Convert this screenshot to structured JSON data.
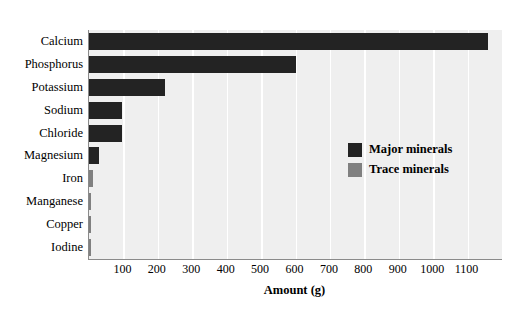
{
  "chart_data": {
    "type": "bar",
    "orientation": "horizontal",
    "title": "",
    "xlabel": "Amount (g)",
    "ylabel": "",
    "xlim": [
      0,
      1200
    ],
    "ylim": null,
    "grid": true,
    "grid_axis": "x",
    "x_ticks": [
      100,
      200,
      300,
      400,
      500,
      600,
      700,
      800,
      900,
      1000,
      1100
    ],
    "x_tick_labels": [
      "100",
      "200",
      "300",
      "400",
      "500",
      "600",
      "700",
      "800",
      "900",
      "1000",
      "1100"
    ],
    "categories": [
      "Calcium",
      "Phosphorus",
      "Potassium",
      "Sodium",
      "Chloride",
      "Magnesium",
      "Iron",
      "Manganese",
      "Copper",
      "Iodine"
    ],
    "values": [
      1160,
      600,
      220,
      95,
      95,
      30,
      12,
      4,
      2,
      1
    ],
    "bar_groups": [
      "major",
      "major",
      "major",
      "major",
      "major",
      "major",
      "trace",
      "trace",
      "trace",
      "trace"
    ],
    "series": [
      {
        "name": "Major minerals",
        "color": "#232323",
        "points": [
          {
            "category": "Calcium",
            "value": 1160
          },
          {
            "category": "Phosphorus",
            "value": 600
          },
          {
            "category": "Potassium",
            "value": 220
          },
          {
            "category": "Sodium",
            "value": 95
          },
          {
            "category": "Chloride",
            "value": 95
          },
          {
            "category": "Magnesium",
            "value": 30
          }
        ]
      },
      {
        "name": "Trace minerals",
        "color": "#808080",
        "points": [
          {
            "category": "Iron",
            "value": 12
          },
          {
            "category": "Manganese",
            "value": 4
          },
          {
            "category": "Copper",
            "value": 2
          },
          {
            "category": "Iodine",
            "value": 1
          }
        ]
      }
    ],
    "legend": {
      "position": "middle-right-inside",
      "entries": [
        {
          "label": "Major minerals",
          "color": "#232323",
          "group": "major"
        },
        {
          "label": "Trace minerals",
          "color": "#808080",
          "group": "trace"
        }
      ]
    },
    "colors": {
      "plot_background": "#efefef",
      "figure_background": "#ffffff",
      "gridline": "#ffffff",
      "axis_line": "#8a8a8a",
      "major_minerals": "#232323",
      "trace_minerals": "#808080",
      "text": "#000000"
    }
  }
}
